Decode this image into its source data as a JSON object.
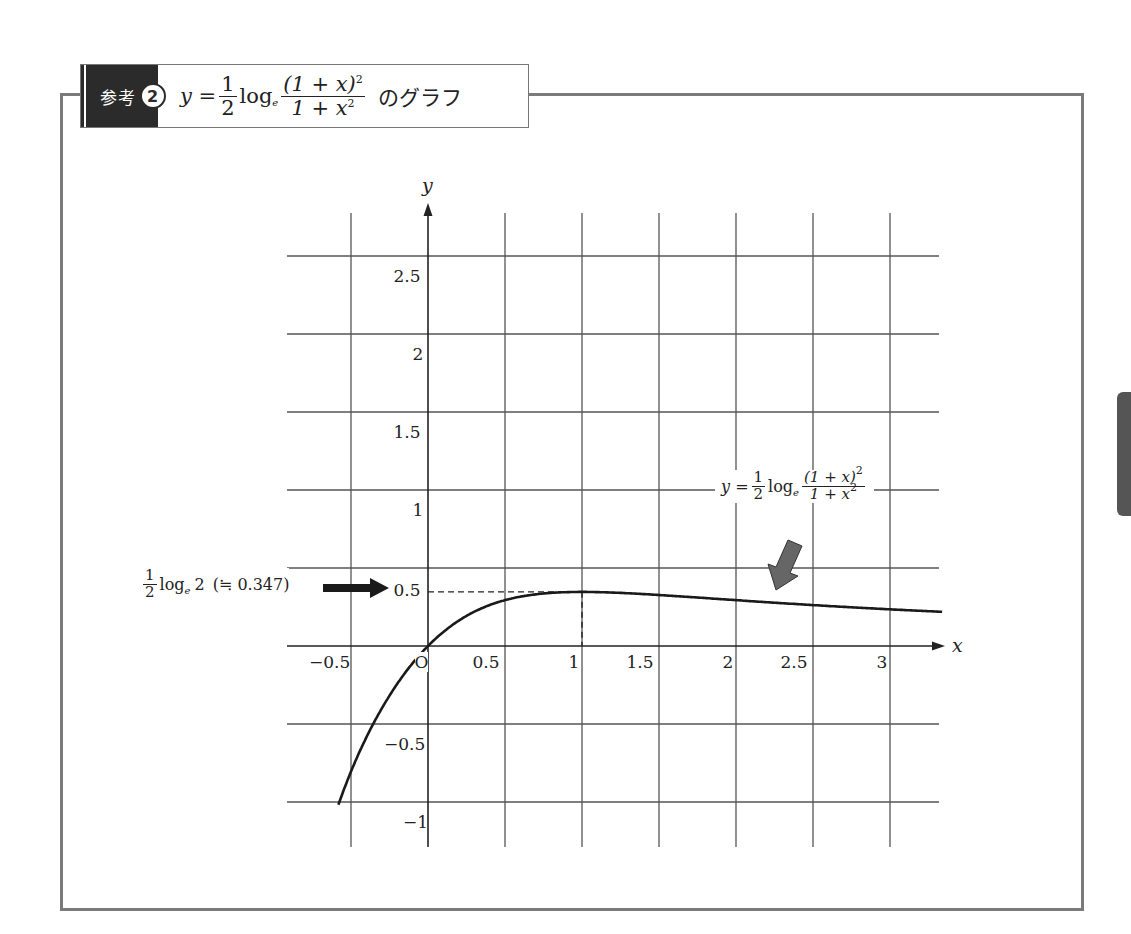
{
  "header": {
    "badge_label": "参考",
    "badge_number": "2",
    "title_prefix": "y =",
    "coef_num": "1",
    "coef_den": "2",
    "log_text": "log",
    "log_base": "e",
    "frac_num": "(1 + x)",
    "frac_num_exp": "2",
    "frac_den": "1 + x",
    "frac_den_exp": "2",
    "title_suffix": "のグラフ"
  },
  "annotations": {
    "curve_label": {
      "prefix": "y =",
      "coef_num": "1",
      "coef_den": "2",
      "log_text": "log",
      "log_base": "e",
      "frac_num": "(1 + x)",
      "frac_num_exp": "2",
      "frac_den": "1 + x",
      "frac_den_exp": "2"
    },
    "max_label": {
      "coef_num": "1",
      "coef_den": "2",
      "log_text": "log",
      "log_base": "e",
      "arg": "2",
      "approx": "(≒ 0.347)"
    }
  },
  "axes": {
    "x_label": "x",
    "y_label": "y",
    "origin_label": "O"
  },
  "colors": {
    "frame": "#7a7a7a",
    "badge": "#2b2b2b",
    "grid": "#555555",
    "curve": "#1a1a1a",
    "gray_arrow": "#666666",
    "black_arrow": "#1a1a1a",
    "side_tab": "#555555"
  },
  "chart_data": {
    "type": "line",
    "function": "y = 0.5 * ln((1+x)^2 / (1+x^2))",
    "xlabel": "x",
    "ylabel": "y",
    "xlim": [
      -0.55,
      3.35
    ],
    "ylim": [
      -1.3,
      2.8
    ],
    "grid": true,
    "x_ticks": [
      -0.5,
      0,
      0.5,
      1,
      1.5,
      2,
      2.5,
      3
    ],
    "x_tick_labels": [
      "−0.5",
      "O",
      "0.5",
      "1",
      "1.5",
      "2",
      "2.5",
      "3"
    ],
    "y_ticks": [
      -1,
      -0.5,
      0.5,
      1,
      1.5,
      2,
      2.5
    ],
    "y_tick_labels": [
      "−1",
      "−0.5",
      "0.5",
      "1",
      "1.5",
      "2",
      "2.5"
    ],
    "series": [
      {
        "name": "y = 1/2 log_e (1+x)^2/(1+x^2)",
        "x": [
          -0.58,
          -0.5,
          -0.4,
          -0.3,
          -0.2,
          -0.1,
          0,
          0.25,
          0.5,
          0.75,
          1,
          1.5,
          2,
          2.5,
          3,
          3.35
        ],
        "y": [
          -1.2,
          -0.92,
          -0.59,
          -0.4,
          -0.24,
          -0.11,
          0,
          0.19,
          0.29,
          0.34,
          0.347,
          0.33,
          0.29,
          0.27,
          0.24,
          0.22
        ]
      }
    ],
    "annotations": [
      {
        "text": "1/2 log_e 2 (≒ 0.347)",
        "x": 1,
        "y": 0.347,
        "type": "maximum",
        "arrow": "black right arrow"
      },
      {
        "text": "y = 1/2 log_e (1+x)^2/(1+x^2)",
        "x": 2.3,
        "y": 0.28,
        "arrow": "gray down-left arrow"
      }
    ],
    "guide_lines": [
      {
        "type": "dashed-horizontal",
        "y": 0.347,
        "from_x": 0,
        "to_x": 1
      },
      {
        "type": "dashed-vertical",
        "x": 1,
        "from_y": 0,
        "to_y": 0.347
      }
    ]
  }
}
